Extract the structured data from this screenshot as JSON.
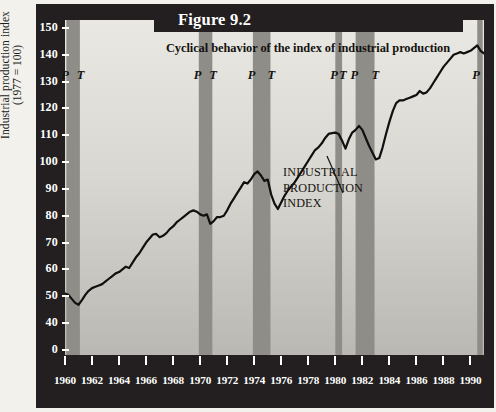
{
  "figure": {
    "banner_label": "Figure 9.2",
    "title": "Cyclical behavior of the index of industrial production",
    "y_axis_title_line1": "Industrial production index",
    "y_axis_title_line2": "(1977 = 100)",
    "annotation_line1": "INDUSTRIAL",
    "annotation_line2": "PRODUCTION",
    "annotation_line3": "INDEX",
    "colors": {
      "frame": "#231f20",
      "banner": "#231f20",
      "plot_light": "#e9e8e3",
      "plot_dark": "#b9b8b2",
      "recession_band": "#8e8d87",
      "line": "#101010",
      "tick_text": "#ffffff"
    }
  },
  "chart_data": {
    "type": "line",
    "title": "Cyclical behavior of the index of industrial production",
    "xlabel": "",
    "ylabel": "Industrial production index (1977 = 100)",
    "xlim": [
      1960,
      1991
    ],
    "ylim": [
      0,
      150
    ],
    "grid": false,
    "legend": "none",
    "y_ticks": [
      0,
      40,
      50,
      60,
      70,
      80,
      90,
      100,
      110,
      120,
      130,
      140,
      150
    ],
    "x_ticks": [
      1960,
      1962,
      1964,
      1966,
      1968,
      1970,
      1972,
      1974,
      1976,
      1978,
      1980,
      1982,
      1984,
      1986,
      1988,
      1990
    ],
    "series": [
      {
        "name": "INDUSTRIAL PRODUCTION INDEX",
        "x": [
          1960.0,
          1960.25,
          1960.5,
          1960.75,
          1961.0,
          1961.25,
          1961.5,
          1961.75,
          1962.0,
          1962.25,
          1962.5,
          1962.75,
          1963.0,
          1963.25,
          1963.5,
          1963.75,
          1964.0,
          1964.25,
          1964.5,
          1964.75,
          1965.0,
          1965.25,
          1965.5,
          1965.75,
          1966.0,
          1966.25,
          1966.5,
          1966.75,
          1967.0,
          1967.25,
          1967.5,
          1967.75,
          1968.0,
          1968.25,
          1968.5,
          1968.75,
          1969.0,
          1969.25,
          1969.5,
          1969.75,
          1970.0,
          1970.25,
          1970.5,
          1970.75,
          1971.0,
          1971.25,
          1971.5,
          1971.75,
          1972.0,
          1972.25,
          1972.5,
          1972.75,
          1973.0,
          1973.25,
          1973.5,
          1973.75,
          1974.0,
          1974.25,
          1974.5,
          1974.75,
          1975.0,
          1975.25,
          1975.5,
          1975.75,
          1976.0,
          1976.25,
          1976.5,
          1976.75,
          1977.0,
          1977.25,
          1977.5,
          1977.75,
          1978.0,
          1978.25,
          1978.5,
          1978.75,
          1979.0,
          1979.25,
          1979.5,
          1979.75,
          1980.0,
          1980.25,
          1980.5,
          1980.75,
          1981.0,
          1981.25,
          1981.5,
          1981.75,
          1982.0,
          1982.25,
          1982.5,
          1982.75,
          1983.0,
          1983.25,
          1983.5,
          1983.75,
          1984.0,
          1984.25,
          1984.5,
          1984.75,
          1985.0,
          1985.25,
          1985.5,
          1985.75,
          1986.0,
          1986.25,
          1986.5,
          1986.75,
          1987.0,
          1987.25,
          1987.5,
          1987.75,
          1988.0,
          1988.25,
          1988.5,
          1988.75,
          1989.0,
          1989.25,
          1989.5,
          1989.75,
          1990.0,
          1990.25,
          1990.5,
          1990.75,
          1991.0
        ],
        "y": [
          51.0,
          50.5,
          49.0,
          47.5,
          46.8,
          48.5,
          50.5,
          52.0,
          53.0,
          53.5,
          54.0,
          54.5,
          55.5,
          56.5,
          57.5,
          58.5,
          59.0,
          60.0,
          61.0,
          60.5,
          62.5,
          64.5,
          66.0,
          68.0,
          70.0,
          71.5,
          73.0,
          73.2,
          72.0,
          72.5,
          73.5,
          75.0,
          76.0,
          77.5,
          78.5,
          79.5,
          80.5,
          81.5,
          82.0,
          81.5,
          80.5,
          80.0,
          80.5,
          77.0,
          78.0,
          79.5,
          79.5,
          80.0,
          82.0,
          84.5,
          86.5,
          88.5,
          90.5,
          92.5,
          92.0,
          93.5,
          95.5,
          96.5,
          95.0,
          93.0,
          93.5,
          88.0,
          84.5,
          82.5,
          85.0,
          87.5,
          89.5,
          91.0,
          92.5,
          94.5,
          96.5,
          98.5,
          100.5,
          102.5,
          104.5,
          105.5,
          107.0,
          109.0,
          110.5,
          110.8,
          111.0,
          110.5,
          108.0,
          105.0,
          108.5,
          111.0,
          112.0,
          113.5,
          112.0,
          109.0,
          106.0,
          103.5,
          101.0,
          101.5,
          105.5,
          110.5,
          115.0,
          119.0,
          122.0,
          123.0,
          123.0,
          123.5,
          124.0,
          124.5,
          125.0,
          126.5,
          125.5,
          126.0,
          127.5,
          129.5,
          131.5,
          133.5,
          135.5,
          137.0,
          138.5,
          140.0,
          140.5,
          141.0,
          140.5,
          141.0,
          141.5,
          142.5,
          143.5,
          141.5,
          140.5
        ]
      }
    ],
    "recession_bands": [
      {
        "peak": 1960.1,
        "trough": 1961.1,
        "peak_label": "P",
        "trough_label": "T"
      },
      {
        "peak": 1969.9,
        "trough": 1970.9,
        "peak_label": "P",
        "trough_label": "T"
      },
      {
        "peak": 1973.9,
        "trough": 1975.2,
        "peak_label": "P",
        "trough_label": "T"
      },
      {
        "peak": 1980.0,
        "trough": 1980.5,
        "peak_label": "P",
        "trough_label": "T"
      },
      {
        "peak": 1981.5,
        "trough": 1982.9,
        "peak_label": "P",
        "trough_label": "T"
      },
      {
        "peak": 1990.5,
        "trough": null,
        "peak_label": "P",
        "trough_label": ""
      }
    ]
  }
}
